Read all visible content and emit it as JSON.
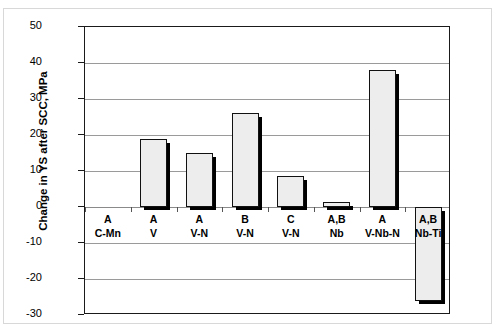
{
  "chart_data": {
    "type": "bar",
    "title": "",
    "xlabel": "",
    "ylabel": "Change in YS after SCC, MPa",
    "ylim": [
      -30,
      50
    ],
    "ytick_step": 10,
    "yticks": [
      50,
      40,
      30,
      20,
      10,
      0,
      -10,
      -20,
      -30
    ],
    "ytick_labels": [
      "50",
      "40",
      "30",
      "20",
      "10",
      "0",
      "-10",
      "-20",
      "-30"
    ],
    "grid": true,
    "legend": "none",
    "categories": [
      "A\nC-Mn",
      "A\nV",
      "A\nV-N",
      "B\nV-N",
      "C\nV-N",
      "A,B\nNb",
      "A\nV-Nb-N",
      "A,B\nNb-Ti"
    ],
    "category_lines": [
      {
        "grade": "A",
        "composition": "C-Mn"
      },
      {
        "grade": "A",
        "composition": "V"
      },
      {
        "grade": "A",
        "composition": "V-N"
      },
      {
        "grade": "B",
        "composition": "V-N"
      },
      {
        "grade": "C",
        "composition": "V-N"
      },
      {
        "grade": "A,B",
        "composition": "Nb"
      },
      {
        "grade": "A",
        "composition": "V-Nb-N"
      },
      {
        "grade": "A,B",
        "composition": "Nb-Ti"
      }
    ],
    "values": [
      0,
      19,
      15,
      26,
      8.5,
      1.5,
      38,
      -26
    ],
    "bar_fill_color": "#ededed",
    "bar_edge_color": "#111111",
    "bar_shadow_color": "#000000"
  },
  "axis": {
    "y_title": "Change in YS after SCC, MPa"
  }
}
